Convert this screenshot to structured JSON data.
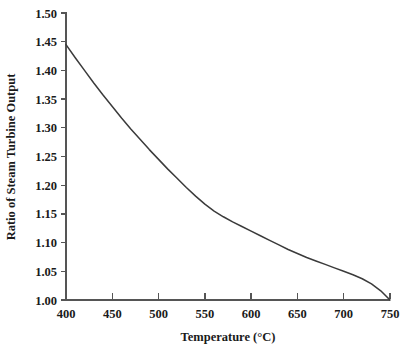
{
  "chart_data": {
    "type": "line",
    "title": "",
    "xlabel": "Temperature (°C)",
    "ylabel": "Ratio of Steam Turbine Output",
    "xlim": [
      400,
      750
    ],
    "ylim": [
      1.0,
      1.5
    ],
    "grid": false,
    "legend": null,
    "xticks": [
      400,
      450,
      500,
      550,
      600,
      650,
      700,
      750
    ],
    "xtick_labels": [
      "400",
      "450",
      "500",
      "550",
      "600",
      "650",
      "700",
      "750"
    ],
    "yticks": [
      1.0,
      1.05,
      1.1,
      1.15,
      1.2,
      1.25,
      1.3,
      1.35,
      1.4,
      1.45,
      1.5
    ],
    "ytick_labels": [
      "1.00",
      "1.05",
      "1.10",
      "1.15",
      "1.20",
      "1.25",
      "1.30",
      "1.35",
      "1.40",
      "1.45",
      "1.50"
    ],
    "series": [
      {
        "name": "Ratio of Steam Turbine Output",
        "color": "#3b3b3b",
        "x": [
          400,
          410,
          420,
          430,
          440,
          450,
          460,
          470,
          480,
          490,
          500,
          510,
          520,
          530,
          540,
          550,
          560,
          570,
          580,
          590,
          600,
          610,
          620,
          630,
          640,
          650,
          660,
          670,
          680,
          690,
          700,
          710,
          720,
          730,
          740,
          750
        ],
        "y": [
          1.445,
          1.422,
          1.4,
          1.378,
          1.357,
          1.337,
          1.317,
          1.298,
          1.28,
          1.262,
          1.245,
          1.228,
          1.212,
          1.196,
          1.181,
          1.167,
          1.155,
          1.145,
          1.136,
          1.128,
          1.12,
          1.112,
          1.104,
          1.096,
          1.088,
          1.081,
          1.074,
          1.068,
          1.062,
          1.056,
          1.05,
          1.044,
          1.037,
          1.028,
          1.016,
          1.0
        ]
      }
    ]
  },
  "axes": {
    "x_title": "Temperature (°C)",
    "y_title": "Ratio of Steam Turbine Output"
  },
  "colors": {
    "curve": "#3b3b3b",
    "axis": "#555555",
    "text": "#1a1a1a",
    "background": "#ffffff"
  }
}
